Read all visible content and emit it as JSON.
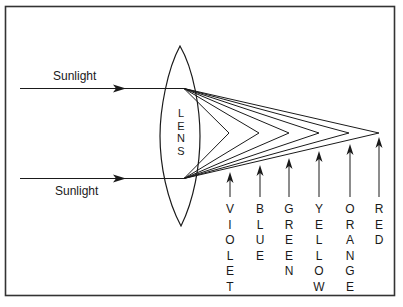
{
  "diagram": {
    "incoming_rays": [
      {
        "label": "Sunlight",
        "position": "upper"
      },
      {
        "label": "Sunlight",
        "position": "lower"
      }
    ],
    "lens_label": "LENS",
    "colors": [
      {
        "name": "VIOLET",
        "x": 230,
        "tip_y": 172
      },
      {
        "name": "BLUE",
        "x": 260,
        "tip_y": 165
      },
      {
        "name": "GREEN",
        "x": 289,
        "tip_y": 158
      },
      {
        "name": "YELLOW",
        "x": 319,
        "tip_y": 151
      },
      {
        "name": "ORANGE",
        "x": 350,
        "tip_y": 144
      },
      {
        "name": "RED",
        "x": 379,
        "tip_y": 137
      }
    ],
    "stroke_color": "#1a1a1a",
    "background_color": "#ffffff"
  }
}
